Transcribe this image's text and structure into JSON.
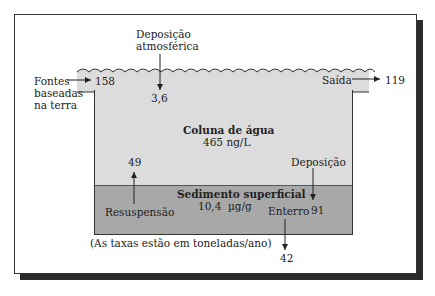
{
  "diagram": {
    "compartments": {
      "water_column": {
        "title": "Coluna de água",
        "value": "465 ng/L"
      },
      "sediment": {
        "title": "Sedimento superficial",
        "value": "10,4",
        "unit": "µg/g"
      }
    },
    "flows": {
      "land_sources": {
        "label_line1": "Fontes",
        "label_line2": "baseadas",
        "label_line3": "na terra",
        "value": "158"
      },
      "atmospheric": {
        "label_line1": "Deposição",
        "label_line2": "atmosférica",
        "value": "3,6"
      },
      "outflow": {
        "label": "Saída",
        "value": "119"
      },
      "resuspension": {
        "label": "Resuspensão",
        "value": "49"
      },
      "deposition": {
        "label": "Deposição",
        "value": "91"
      },
      "burial": {
        "label": "Enterro",
        "value": "42"
      }
    },
    "caption": "(As taxas estão em toneladas/ano)",
    "colors": {
      "water": "#dcdcdc",
      "sediment": "#a8a8a8",
      "frame": "#333333",
      "shadow": "#2a2a2a"
    }
  }
}
